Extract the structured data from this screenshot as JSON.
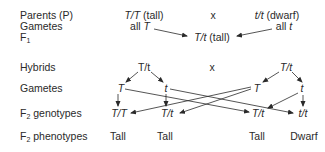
{
  "labels": {
    "parents": "Parents (P)",
    "gametes1": "Gametes",
    "f1_base": "F",
    "f1_sub": "1",
    "hybrids": "Hybrids",
    "gametes2": "Gametes",
    "f2g_base": "F",
    "f2g_sub": "2",
    "f2g_rest": " genotypes",
    "f2p_base": "F",
    "f2p_sub": "2",
    "f2p_rest": " phenotypes"
  },
  "parents": {
    "left_genotype": "T/T",
    "left_phenotype": " (tall)",
    "cross": "x",
    "right_genotype": "t/t",
    "right_phenotype": " (dwarf)"
  },
  "gametes1": {
    "left_prefix": "all ",
    "left_allele": "T",
    "right_prefix": "all ",
    "right_allele": "t"
  },
  "f1": {
    "genotype": "T/t",
    "phenotype": " (tall)"
  },
  "hybrids": {
    "left": "T/t",
    "cross": "x",
    "right": "T/t"
  },
  "gametes2": [
    "T",
    "t",
    "T",
    "t"
  ],
  "f2_genotypes": [
    "T/T",
    "T/t",
    "T/t",
    "t/t"
  ],
  "f2_phenotypes": [
    "Tall",
    "Tall",
    "Tall",
    "Dwarf"
  ]
}
